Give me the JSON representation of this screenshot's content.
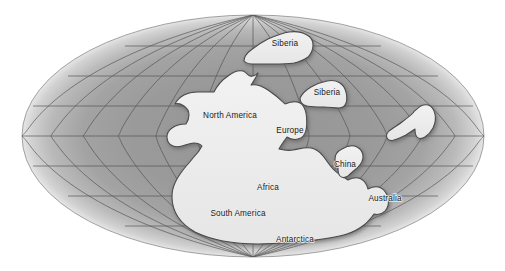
{
  "figure": {
    "projection": "elliptical (Mollweide-style) world projection",
    "background_color": "#ffffff"
  },
  "colors": {
    "ocean": "#9a9a9a",
    "ocean_edge_highlight": "#d6d6d6",
    "land": "#ededed",
    "land_outline": "#4a4a4a",
    "graticule": "#4f4f4f",
    "shadow": "#6e6e6e",
    "label_text": "#1b1b1b"
  },
  "globe": {
    "center_x": 253,
    "center_y": 136,
    "radius_x": 231,
    "radius_y": 121,
    "graticule": {
      "parallels": 7,
      "meridians": 13,
      "grid_visible": true
    }
  },
  "labels": [
    {
      "id": "siberia-north",
      "text": "Siberia",
      "x": 285,
      "y": 44
    },
    {
      "id": "siberia-east",
      "text": "Siberia",
      "x": 327,
      "y": 93
    },
    {
      "id": "north-america",
      "text": "North America",
      "x": 230,
      "y": 116
    },
    {
      "id": "europe",
      "text": "Europe",
      "x": 290,
      "y": 131
    },
    {
      "id": "china",
      "text": "China",
      "x": 345,
      "y": 165
    },
    {
      "id": "africa",
      "text": "Africa",
      "x": 268,
      "y": 188
    },
    {
      "id": "australia",
      "text": "Australia",
      "x": 385,
      "y": 199
    },
    {
      "id": "south-america",
      "text": "South America",
      "x": 238,
      "y": 214
    },
    {
      "id": "antarctica",
      "text": "Antarctica",
      "x": 295,
      "y": 240
    }
  ],
  "landmasses": [
    {
      "id": "pangaea-main",
      "name": "Pangaea main landmass",
      "labelled": true
    },
    {
      "id": "siberia-north",
      "name": "Siberia northern block",
      "labelled": true
    },
    {
      "id": "siberia-east",
      "name": "Siberia eastern block",
      "labelled": true
    },
    {
      "id": "china-block",
      "name": "China block",
      "labelled": true
    },
    {
      "id": "india-block",
      "name": "Unlabelled boot-shaped landmass",
      "labelled": false
    }
  ]
}
